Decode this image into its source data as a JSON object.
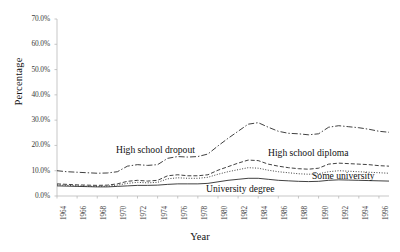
{
  "chart_data": {
    "type": "line",
    "title": "",
    "xlabel": "Year",
    "ylabel": "Percentage",
    "grid": false,
    "legend_position": "inline-annotations",
    "ylim": [
      0,
      70
    ],
    "ytick_labels": [
      "0.0%",
      "10.0%",
      "20.0%",
      "30.0%",
      "40.0%",
      "50.0%",
      "60.0%",
      "70.0%"
    ],
    "ytick_values": [
      0,
      10,
      20,
      30,
      40,
      50,
      60,
      70
    ],
    "xtick_labels": [
      "1964",
      "1966",
      "1968",
      "1970",
      "1972",
      "1974",
      "1976",
      "1978",
      "1980",
      "1982",
      "1984",
      "1986",
      "1988",
      "1990",
      "1992",
      "1994",
      "1996"
    ],
    "x": [
      1964,
      1965,
      1966,
      1967,
      1968,
      1969,
      1970,
      1971,
      1972,
      1973,
      1974,
      1975,
      1976,
      1977,
      1978,
      1979,
      1980,
      1981,
      1982,
      1983,
      1984,
      1985,
      1986,
      1987,
      1988,
      1989,
      1990,
      1991,
      1992,
      1993,
      1994,
      1995,
      1996,
      1997
    ],
    "series": [
      {
        "name": "High school dropout",
        "style": "dash-dot",
        "values": [
          10.0,
          9.6,
          9.4,
          9.2,
          9.0,
          9.1,
          9.6,
          11.8,
          12.4,
          12.1,
          12.4,
          14.9,
          15.6,
          15.4,
          15.6,
          16.6,
          19.8,
          22.8,
          25.6,
          28.4,
          29.0,
          27.2,
          25.6,
          24.8,
          24.6,
          24.2,
          24.6,
          27.2,
          27.8,
          27.4,
          27.0,
          26.4,
          25.6,
          25.2
        ]
      },
      {
        "name": "High school diploma",
        "style": "dash",
        "values": [
          4.8,
          4.6,
          4.4,
          4.3,
          4.2,
          4.3,
          4.8,
          5.8,
          6.2,
          5.9,
          6.2,
          8.0,
          8.4,
          8.0,
          8.0,
          8.4,
          10.2,
          11.6,
          13.0,
          14.2,
          14.0,
          12.6,
          11.8,
          11.2,
          10.8,
          10.6,
          11.0,
          12.6,
          13.0,
          12.8,
          12.6,
          12.4,
          12.0,
          11.8
        ]
      },
      {
        "name": "Some university",
        "style": "dotted",
        "values": [
          4.4,
          4.2,
          4.0,
          3.9,
          3.8,
          3.9,
          4.3,
          5.0,
          5.4,
          5.2,
          5.4,
          6.8,
          7.2,
          7.0,
          7.0,
          7.4,
          8.6,
          9.6,
          10.4,
          11.2,
          11.0,
          10.2,
          9.6,
          9.2,
          8.8,
          8.6,
          8.8,
          9.6,
          10.0,
          9.8,
          9.6,
          9.4,
          9.2,
          9.0
        ]
      },
      {
        "name": "University degree",
        "style": "solid",
        "values": [
          4.0,
          3.9,
          3.8,
          3.7,
          3.6,
          3.6,
          3.8,
          4.0,
          4.2,
          4.2,
          4.3,
          4.6,
          4.8,
          4.8,
          4.8,
          5.0,
          5.6,
          6.2,
          6.6,
          7.0,
          7.0,
          6.6,
          6.2,
          6.0,
          5.8,
          5.7,
          5.8,
          6.2,
          6.4,
          6.3,
          6.2,
          6.1,
          6.0,
          5.9
        ]
      }
    ],
    "annotations": [
      {
        "text": "High school dropout",
        "x_px": 116,
        "y_px": 144
      },
      {
        "text": "High school diploma",
        "x_px": 268,
        "y_px": 147
      },
      {
        "text": "Some university",
        "x_px": 312,
        "y_px": 170
      },
      {
        "text": "University degree",
        "x_px": 206,
        "y_px": 183
      }
    ]
  }
}
